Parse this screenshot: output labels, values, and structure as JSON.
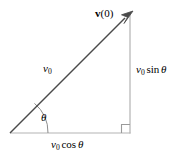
{
  "figure": {
    "kind": "physics-vector-diagram",
    "background_color": "#ffffff",
    "width": 176,
    "height": 160
  },
  "colors": {
    "vector_stroke": "#4a4a4a",
    "leg_stroke": "#b3b3b3",
    "arc_stroke": "#8c8c8c",
    "right_angle_stroke": "#9a9a9a",
    "text": "#000000"
  },
  "geometry": {
    "origin": {
      "x": 10,
      "y": 133
    },
    "apex": {
      "x": 131,
      "y": 13
    },
    "corner": {
      "x": 130,
      "y": 133
    },
    "arrow_tip": {
      "x": 133,
      "y": 11
    },
    "angle_arc_radius": 38,
    "right_angle_size": 8
  },
  "labels": {
    "vector_at_time_zero": {
      "vector_symbol": "v",
      "argument": "(0)",
      "plain": "v(0)",
      "style": "bold-upright"
    },
    "magnitude": {
      "symbol": "v",
      "subscript": "0",
      "plain": "v0",
      "style": "italic"
    },
    "vertical_component": {
      "symbol": "v",
      "subscript": "0",
      "function": "sin",
      "angle": "θ",
      "plain": "v0 sin θ"
    },
    "horizontal_component": {
      "symbol": "v",
      "subscript": "0",
      "function": "cos",
      "angle": "θ",
      "plain": "v0 cos θ"
    },
    "angle": {
      "symbol": "θ",
      "plain": "θ",
      "style": "italic"
    }
  }
}
